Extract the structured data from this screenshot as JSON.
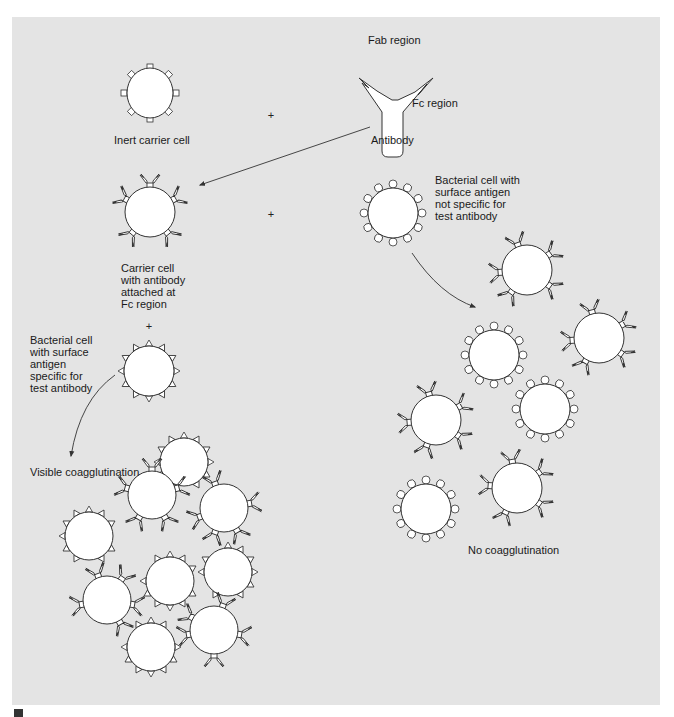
{
  "diagram": {
    "title_hint": "Coagglutination test principle",
    "labels": {
      "fab_region": "Fab region",
      "fc_region": "Fc region",
      "antibody": "Antibody",
      "inert_carrier_cell": "Inert carrier cell",
      "carrier_cell_with_antibody": "Carrier cell\nwith antibody\nattached at\nFc region",
      "bacterial_cell_specific": "Bacterial cell\nwith surface\nantigen\nspecific for\ntest antibody",
      "bacterial_cell_not_specific": "Bacterial cell with\nsurface antigen\nnot specific for\ntest antibody",
      "visible_coagglutination": "Visible coagglutination",
      "no_coagglutination": "No coagglutination"
    },
    "operators": {
      "plus": "+"
    },
    "colors": {
      "panel_background": "#e4e4e4",
      "cell_fill": "#ffffff",
      "stroke": "#333333",
      "text": "#1a1a1a"
    }
  }
}
